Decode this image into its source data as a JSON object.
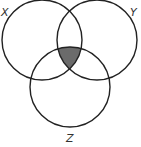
{
  "diagram": {
    "type": "venn",
    "sets": [
      {
        "id": "X",
        "label": "X",
        "cx": 42,
        "cy": 40,
        "r": 40
      },
      {
        "id": "Y",
        "label": "Y",
        "cx": 97,
        "cy": 40,
        "r": 40
      },
      {
        "id": "Z",
        "label": "Z",
        "cx": 70,
        "cy": 87,
        "r": 40
      }
    ],
    "shaded_region": "X ∩ Y ∩ Z",
    "colors": {
      "stroke": "#222222",
      "shade": "#6b6b6b",
      "background": "#ffffff"
    }
  }
}
